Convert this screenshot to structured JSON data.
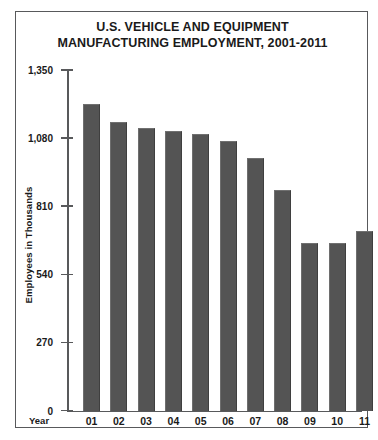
{
  "chart_data": {
    "type": "bar",
    "title": "U.S. VEHICLE AND EQUIPMENT MANUFACTURING EMPLOYMENT, 2001-2011",
    "title_lines": [
      "U.S. VEHICLE AND EQUIPMENT",
      "MANUFACTURING EMPLOYMENT, 2001-2011"
    ],
    "xlabel": "Year",
    "ylabel": "Employees in Thousands",
    "categories": [
      "01",
      "02",
      "03",
      "04",
      "05",
      "06",
      "07",
      "08",
      "09",
      "10",
      "11"
    ],
    "values": [
      1215,
      1145,
      1120,
      1110,
      1095,
      1070,
      1000,
      875,
      665,
      665,
      710
    ],
    "ylim": [
      0,
      1350
    ],
    "yticks": [
      0,
      270,
      540,
      810,
      1080,
      1350
    ],
    "ytick_labels": [
      "0",
      "270",
      "540",
      "810",
      "1,080",
      "1,350"
    ],
    "grid": false,
    "legend": null,
    "bar_color": "#545454",
    "axis_color": "#58595b",
    "text_color": "#1a1a1a",
    "background": "#ffffff"
  }
}
